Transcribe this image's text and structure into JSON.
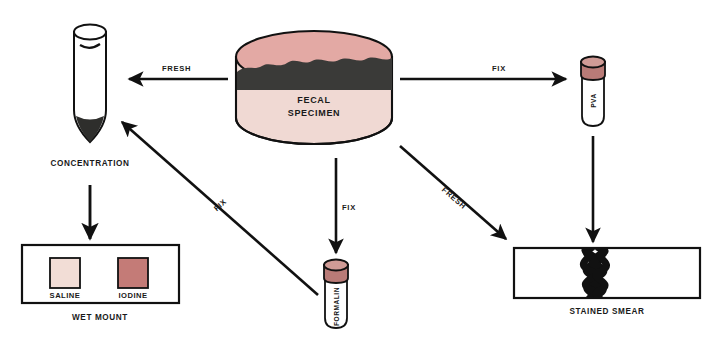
{
  "diagram": {
    "background_color": "#ffffff",
    "ink_color": "#1a1a1a"
  },
  "colors": {
    "specimen_top": "#e3a9a4",
    "specimen_body": "#f0d9d3",
    "specimen_contents": "#3a3a38",
    "saline_swatch": "#f2ddd6",
    "iodine_swatch": "#c47b77",
    "vial_cap": "#d09b96",
    "vial_cap_shadow": "#b97b77",
    "sediment": "#2e2e2c",
    "outline": "#111111"
  },
  "specimen": {
    "name": "fecal-specimen-container",
    "label_line1": "FECAL",
    "label_line2": "SPECIMEN"
  },
  "nodes": {
    "concentration": {
      "label": "CONCENTRATION",
      "type": "centrifuge-tube"
    },
    "wet_mount": {
      "label": "WET MOUNT",
      "type": "microscope-slide",
      "swatches": [
        {
          "name": "saline",
          "label": "SALINE",
          "color": "#f2ddd6"
        },
        {
          "name": "iodine",
          "label": "IODINE",
          "color": "#c47b77"
        }
      ]
    },
    "pva": {
      "label": "PVA",
      "type": "preservative-vial"
    },
    "formalin": {
      "label": "FORMALIN",
      "type": "preservative-vial"
    },
    "stained_smear": {
      "label": "STAINED SMEAR",
      "type": "microscope-slide"
    }
  },
  "arrows": [
    {
      "name": "specimen-to-concentration",
      "label": "FRESH",
      "direction": "left"
    },
    {
      "name": "specimen-to-pva",
      "label": "FIX",
      "direction": "right"
    },
    {
      "name": "specimen-to-formalin",
      "label": "FIX",
      "direction": "down"
    },
    {
      "name": "specimen-to-stained-smear",
      "label": "FRESH",
      "direction": "down-right"
    },
    {
      "name": "formalin-to-concentration",
      "label": "FIX",
      "direction": "up-left"
    },
    {
      "name": "concentration-to-wet-mount",
      "label": "",
      "direction": "down"
    },
    {
      "name": "pva-to-stained-smear",
      "label": "",
      "direction": "down"
    }
  ]
}
